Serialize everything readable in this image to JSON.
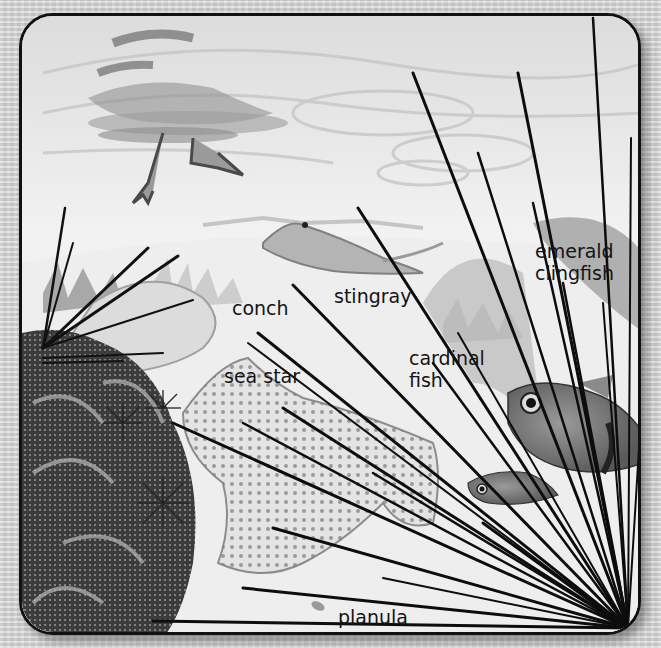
{
  "scene": {
    "description": "Grayscale illustration of a coral reef seen through a polyp-like radiating tentacle frame",
    "palette": {
      "frame_border": "#111111",
      "water_light": "#f2f2f2",
      "water_mid": "#d4d4d4",
      "sand": "#eeeeee",
      "coral_dark": "#3a3a3a",
      "tentacle": "#111111",
      "label_text": "#141414"
    }
  },
  "labels": [
    {
      "id": "conch",
      "text": "conch",
      "x": 232,
      "y": 297
    },
    {
      "id": "stingray",
      "text": "stingray",
      "x": 334,
      "y": 285
    },
    {
      "id": "sea-star",
      "text": "sea star",
      "x": 224,
      "y": 365
    },
    {
      "id": "cardinal-fish",
      "text": "cardinal\nfish",
      "x": 409,
      "y": 347
    },
    {
      "id": "emerald-clingfish",
      "text": "emerald\nclingfish",
      "x": 535,
      "y": 240
    },
    {
      "id": "planula",
      "text": "planula",
      "x": 338,
      "y": 606
    }
  ]
}
